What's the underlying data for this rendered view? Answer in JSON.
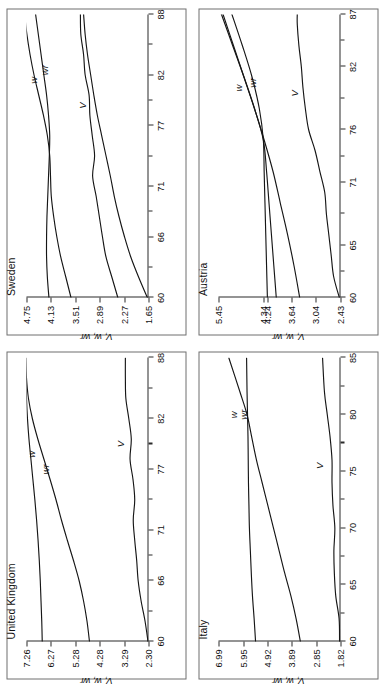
{
  "figure": {
    "orientation": "rotated-90-ccw",
    "panel_count": 4,
    "series_names": [
      "w",
      "wr",
      "V"
    ],
    "axis_title": "V, w, wr",
    "line_color": "#161616",
    "frame_color": "#6f6f6f"
  },
  "chart_data": [
    {
      "type": "line",
      "title": "United Kingdom",
      "xlabel": "",
      "ylabel": "V, w, wr",
      "grid": false,
      "legend": "inline-labels",
      "xticks": [
        60,
        66,
        71,
        77,
        82,
        88
      ],
      "yticks": [
        2.3,
        3.29,
        4.28,
        5.28,
        6.27,
        7.26
      ],
      "xlim": [
        60,
        88
      ],
      "ylim": [
        2.3,
        7.26
      ],
      "series": [
        {
          "name": "w",
          "x": [
            60,
            62,
            64,
            66,
            68,
            70,
            72,
            74,
            76,
            78,
            80,
            82,
            84,
            86,
            88
          ],
          "values": [
            6.62,
            6.64,
            6.67,
            6.7,
            6.74,
            6.79,
            6.85,
            6.92,
            7.0,
            7.08,
            7.16,
            7.22,
            7.26,
            7.28,
            7.29
          ]
        },
        {
          "name": "wr",
          "x": [
            60,
            62,
            64,
            66,
            68,
            70,
            72,
            74,
            76,
            78,
            80,
            82,
            84,
            86,
            88
          ],
          "values": [
            4.7,
            4.8,
            4.94,
            5.12,
            5.35,
            5.6,
            5.84,
            6.06,
            6.3,
            6.55,
            6.8,
            7.02,
            7.18,
            7.26,
            7.29
          ]
        },
        {
          "name": "V",
          "x": [
            60,
            62,
            64,
            66,
            68,
            70,
            72,
            74,
            76,
            78,
            80,
            82,
            84,
            86,
            88
          ],
          "values": [
            2.32,
            2.44,
            2.6,
            2.72,
            2.78,
            2.86,
            2.92,
            2.86,
            2.93,
            3.05,
            3.0,
            3.1,
            3.22,
            3.24,
            3.24
          ]
        }
      ],
      "series_label_positions": [
        {
          "name": "w",
          "x": 78.5,
          "y": 7.05
        },
        {
          "name": "wr",
          "x": 77.0,
          "y": 6.5
        },
        {
          "name": "V",
          "x": 79.5,
          "y": 3.45
        }
      ]
    },
    {
      "type": "line",
      "title": "Sweden",
      "xlabel": "",
      "ylabel": "V, w, wr",
      "grid": false,
      "legend": "inline-labels",
      "xticks": [
        60,
        66,
        71,
        77,
        82,
        88
      ],
      "yticks": [
        1.65,
        2.27,
        2.89,
        3.51,
        4.13,
        4.75
      ],
      "xlim": [
        60,
        88
      ],
      "ylim": [
        1.65,
        4.75
      ],
      "series": [
        {
          "name": "w",
          "x": [
            60,
            62,
            64,
            66,
            68,
            70,
            72,
            74,
            76,
            78,
            80,
            82,
            84,
            86,
            88
          ],
          "values": [
            3.62,
            3.75,
            3.88,
            3.98,
            4.06,
            4.12,
            4.14,
            4.16,
            4.22,
            4.32,
            4.44,
            4.56,
            4.66,
            4.74,
            4.8
          ]
        },
        {
          "name": "wr",
          "x": [
            60,
            62,
            64,
            66,
            68,
            70,
            72,
            74,
            76,
            78,
            80,
            82,
            84,
            86,
            88
          ],
          "values": [
            4.18,
            4.22,
            4.24,
            4.24,
            4.23,
            4.21,
            4.19,
            4.17,
            4.16,
            4.19,
            4.24,
            4.31,
            4.38,
            4.45,
            4.52
          ]
        },
        {
          "name": "V",
          "x": [
            60,
            62,
            64,
            66,
            68,
            70,
            72,
            74,
            76,
            78,
            80,
            82,
            84,
            86,
            88
          ],
          "values": [
            2.43,
            2.58,
            2.73,
            2.82,
            2.9,
            2.98,
            3.07,
            3.02,
            3.08,
            3.14,
            3.16,
            3.26,
            3.3,
            3.37,
            3.38
          ]
        },
        {
          "name": "V2",
          "x": [
            60,
            62,
            64,
            66,
            68,
            70,
            72,
            74,
            76,
            78,
            80,
            82,
            84,
            86,
            88
          ],
          "values": [
            1.68,
            1.9,
            2.1,
            2.26,
            2.4,
            2.52,
            2.62,
            2.73,
            2.84,
            2.95,
            3.04,
            3.12,
            3.2,
            3.26,
            3.3
          ]
        }
      ],
      "series_label_positions": [
        {
          "name": "w",
          "x": 81.5,
          "y": 4.58
        },
        {
          "name": "wr",
          "x": 82.5,
          "y": 4.3
        },
        {
          "name": "V",
          "x": 79.0,
          "y": 3.32
        }
      ]
    },
    {
      "type": "line",
      "title": "Italy",
      "xlabel": "",
      "ylabel": "V, w, wr",
      "grid": false,
      "legend": "inline-labels",
      "xticks": [
        60,
        65,
        70,
        75,
        80,
        85
      ],
      "yticks": [
        1.82,
        2.85,
        3.89,
        4.92,
        5.95,
        6.99
      ],
      "xlim": [
        60,
        85
      ],
      "ylim": [
        1.82,
        6.99
      ],
      "series": [
        {
          "name": "w",
          "x": [
            60,
            62,
            64,
            66,
            68,
            70,
            72,
            74,
            76,
            78,
            80,
            82,
            85
          ],
          "values": [
            5.42,
            5.48,
            5.55,
            5.6,
            5.64,
            5.68,
            5.7,
            5.72,
            5.73,
            5.74,
            5.76,
            5.78,
            5.8
          ]
        },
        {
          "name": "wr",
          "x": [
            60,
            62,
            64,
            66,
            68,
            70,
            72,
            74,
            76,
            78,
            80,
            82,
            85
          ],
          "values": [
            3.52,
            3.7,
            3.92,
            4.18,
            4.42,
            4.66,
            4.9,
            5.14,
            5.38,
            5.58,
            5.78,
            6.08,
            6.55
          ]
        },
        {
          "name": "V",
          "x": [
            60,
            62,
            64,
            66,
            68,
            70,
            72,
            74,
            76,
            78,
            80,
            82,
            85
          ],
          "values": [
            1.86,
            1.88,
            2.02,
            2.08,
            2.1,
            2.06,
            2.14,
            2.18,
            2.18,
            2.26,
            2.38,
            2.5,
            2.58
          ]
        }
      ],
      "series_label_positions": [
        {
          "name": "w",
          "x": 80.0,
          "y": 6.35
        },
        {
          "name": "wr",
          "x": 80.0,
          "y": 5.95
        },
        {
          "name": "V",
          "x": 75.5,
          "y": 2.7
        }
      ]
    },
    {
      "type": "line",
      "title": "Austria",
      "xlabel": "",
      "ylabel": "V, w, wr",
      "grid": false,
      "legend": "inline-labels",
      "xticks": [
        60,
        65,
        71,
        76,
        82,
        87
      ],
      "yticks": [
        2.43,
        3.04,
        3.64,
        4.24,
        4.34,
        5.45
      ],
      "ytick_labels": [
        "2.43",
        "3.04",
        "3.64",
        "4.24",
        "4.34",
        "5.45"
      ],
      "xlim": [
        60,
        87
      ],
      "ylim": [
        2.43,
        5.45
      ],
      "series": [
        {
          "name": "w",
          "x": [
            60,
            63,
            66,
            69,
            72,
            75,
            78,
            81,
            84,
            87
          ],
          "values": [
            4.02,
            4.08,
            4.14,
            4.2,
            4.26,
            4.34,
            4.56,
            4.82,
            5.1,
            5.38
          ]
        },
        {
          "name": "wr",
          "x": [
            60,
            63,
            66,
            69,
            72,
            75,
            78,
            81,
            84,
            87
          ],
          "values": [
            4.24,
            4.26,
            4.28,
            4.3,
            4.32,
            4.34,
            4.44,
            4.62,
            4.86,
            5.12
          ]
        },
        {
          "name": "wr2",
          "x": [
            60,
            63,
            66,
            69,
            72,
            75,
            78,
            81,
            84,
            87
          ],
          "values": [
            3.44,
            3.58,
            3.74,
            3.92,
            4.1,
            4.32,
            4.56,
            4.82,
            5.08,
            5.34
          ]
        },
        {
          "name": "V",
          "x": [
            60,
            62,
            64,
            66,
            68,
            70,
            72,
            74,
            76,
            78,
            80,
            82,
            84,
            86,
            87
          ],
          "values": [
            2.46,
            2.6,
            2.66,
            2.72,
            2.78,
            2.82,
            2.94,
            3.06,
            3.22,
            3.3,
            3.36,
            3.4,
            3.46,
            3.5,
            3.5
          ]
        }
      ],
      "series_label_positions": [
        {
          "name": "w",
          "x": 80.0,
          "y": 4.95
        },
        {
          "name": "wr",
          "x": 80.5,
          "y": 4.62
        },
        {
          "name": "V",
          "x": 79.5,
          "y": 3.56
        }
      ]
    }
  ]
}
